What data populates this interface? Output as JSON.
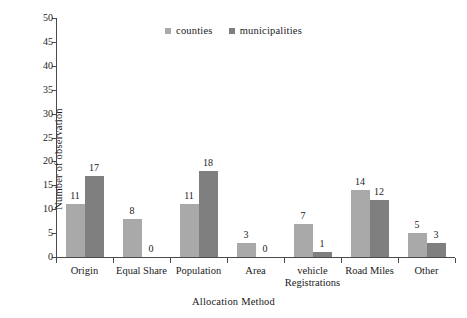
{
  "chart_data": {
    "type": "bar",
    "title": "",
    "subtitle": "",
    "xlabel": "Allocation Method",
    "ylabel": "Number of observation",
    "categories": [
      "Origin",
      "Equal Share",
      "Population",
      "Area",
      "vehicle Registrations",
      "Road Miles",
      "Other"
    ],
    "category_lines": [
      [
        "Origin"
      ],
      [
        "Equal Share"
      ],
      [
        "Population"
      ],
      [
        "Area"
      ],
      [
        "vehicle",
        "Registrations"
      ],
      [
        "Road Miles"
      ],
      [
        "Other"
      ]
    ],
    "series": [
      {
        "name": "counties",
        "color": "#a9a9a9",
        "values": [
          11,
          8,
          11,
          3,
          7,
          14,
          5
        ]
      },
      {
        "name": "municipalities",
        "color": "#7f7f7f",
        "values": [
          17,
          0,
          18,
          0,
          1,
          12,
          3
        ]
      }
    ],
    "ylim": [
      0,
      50
    ],
    "ytick_step": 5,
    "ytick_labels": [
      "0",
      "5",
      "10",
      "15",
      "20",
      "25",
      "30",
      "35",
      "40",
      "45",
      "50"
    ],
    "grid": false,
    "legend_position": "top-center",
    "show_value_labels": true
  },
  "legend": {
    "entries": [
      {
        "label": "counties",
        "color": "#a9a9a9"
      },
      {
        "label": "municipalities",
        "color": "#7f7f7f"
      }
    ]
  },
  "axis_titles": {
    "x": "Allocation Method",
    "y": "Number of observation"
  }
}
